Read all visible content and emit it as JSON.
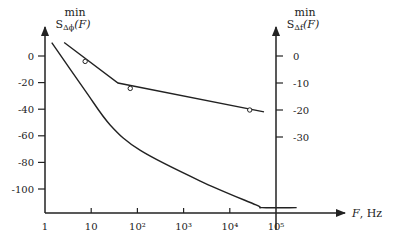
{
  "chart_data": {
    "type": "line",
    "title": "",
    "xlabel": "F, Hz",
    "x_scale": "log",
    "xlim": [
      1,
      100000
    ],
    "x_ticks": [
      1,
      10,
      100,
      1000,
      10000,
      100000
    ],
    "x_tick_labels": [
      "1",
      "10",
      "10²",
      "10³",
      "10⁴",
      "10⁵"
    ],
    "left_axis": {
      "label_top": "min",
      "label_main": "S",
      "label_sub": "Δϕ",
      "label_arg": "(F)",
      "ticks": [
        0,
        -20,
        -40,
        -60,
        -80,
        -100
      ],
      "tick_labels": [
        "0",
        "-20",
        "-40",
        "-60",
        "-80",
        "-100"
      ],
      "ylim": [
        -120,
        10
      ]
    },
    "right_axis": {
      "label_top": "min",
      "label_main": "S",
      "label_sub": "Δf",
      "label_arg": "(F)",
      "ticks": [
        0,
        -10,
        -20,
        -30
      ],
      "tick_labels": [
        "0",
        "-10",
        "-20",
        "-30"
      ],
      "ylim": [
        -60,
        5
      ]
    },
    "series": [
      {
        "name": "S_Δf min (piecewise linear, right axis)",
        "axis": "right",
        "style": "line",
        "x": [
          2.6,
          38,
          55000
        ],
        "y": [
          5,
          -10,
          -20.7
        ]
      },
      {
        "name": "S_Δf measured points (right axis)",
        "axis": "right",
        "style": "markers",
        "marker": "open-circle",
        "x": [
          7.4,
          70,
          27000
        ],
        "y": [
          -2,
          -12,
          -20
        ]
      },
      {
        "name": "S_Δϕ min (curve, left axis)",
        "axis": "left",
        "style": "line",
        "x": [
          1.4,
          7.4,
          26,
          116,
          2300,
          37000,
          50000,
          280000
        ],
        "y": [
          10,
          -26,
          -52,
          -71,
          -94,
          -112,
          -114,
          -114
        ]
      }
    ],
    "grid": false,
    "legend": null
  },
  "colors": {
    "ink": "#222222",
    "background": "#ffffff"
  }
}
